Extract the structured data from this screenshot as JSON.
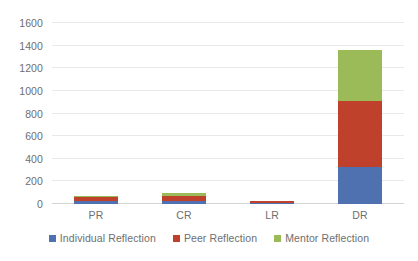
{
  "chart_data": {
    "type": "bar",
    "subtype": "stacked-column",
    "title": "",
    "xlabel": "",
    "ylabel": "",
    "categories": [
      "PR",
      "CR",
      "LR",
      "DR"
    ],
    "series": [
      {
        "name": "Individual Reflection",
        "color": "#4F71B0",
        "values": [
          27,
          30,
          4,
          330
        ]
      },
      {
        "name": "Peer Reflection",
        "color": "#C0412B",
        "values": [
          36,
          45,
          16,
          585
        ]
      },
      {
        "name": "Mentor Reflection",
        "color": "#9BBB59",
        "values": [
          8,
          23,
          0,
          445
        ]
      }
    ],
    "totals": [
      71,
      98,
      20,
      1360
    ],
    "ylim": [
      0,
      1600
    ],
    "ytick_step": 200,
    "yticks": [
      0,
      200,
      400,
      600,
      800,
      1000,
      1200,
      1400,
      1600
    ],
    "ytick_labels": [
      "0",
      "200",
      "400",
      "600",
      "800",
      "1000",
      "1200",
      "1400",
      "1600"
    ],
    "grid": true,
    "grid_color": "#E9E9E9",
    "legend_position": "bottom",
    "background": "#FFFFFF",
    "text_color": "#6E6E6E"
  }
}
